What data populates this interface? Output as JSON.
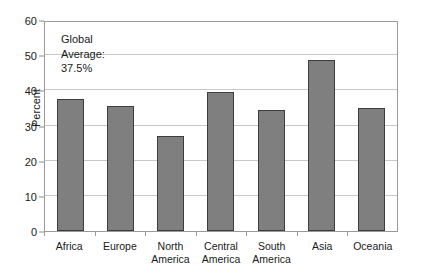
{
  "chart_data": {
    "type": "bar",
    "title": "",
    "xlabel": "",
    "ylabel": "Percent",
    "categories": [
      "Africa",
      "Europe",
      "North America",
      "Central America",
      "South America",
      "Asia",
      "Oceania"
    ],
    "values": [
      37.5,
      35.5,
      27.0,
      39.5,
      34.3,
      48.7,
      35.0
    ],
    "ylim": [
      0,
      60
    ],
    "ytick_labels": [
      "0",
      "10",
      "20",
      "30",
      "40",
      "50",
      "60"
    ],
    "ytick_values": [
      0,
      10,
      20,
      30,
      40,
      50,
      60
    ],
    "grid": "horizontal",
    "legend": "none",
    "annotations": [
      {
        "line1": "Global",
        "line2": "Average:",
        "line3": "37.5%"
      }
    ],
    "series": [
      {
        "name": "Percent",
        "color": "#7f7f7f",
        "values": [
          37.5,
          35.5,
          27.0,
          39.5,
          34.3,
          48.7,
          35.0
        ]
      }
    ]
  },
  "colors": {
    "bar_fill": "#7f7f7f",
    "bar_border": "#3d3d3d",
    "gridline": "#c8c8c8",
    "axis": "#9a9a9a",
    "text": "#1a1a1a",
    "background": "#ffffff"
  },
  "x_labels": [
    {
      "line1": "Africa",
      "line2": ""
    },
    {
      "line1": "Europe",
      "line2": ""
    },
    {
      "line1": "North",
      "line2": "America"
    },
    {
      "line1": "Central",
      "line2": "America"
    },
    {
      "line1": "South",
      "line2": "America"
    },
    {
      "line1": "Asia",
      "line2": ""
    },
    {
      "line1": "Oceania",
      "line2": ""
    }
  ]
}
